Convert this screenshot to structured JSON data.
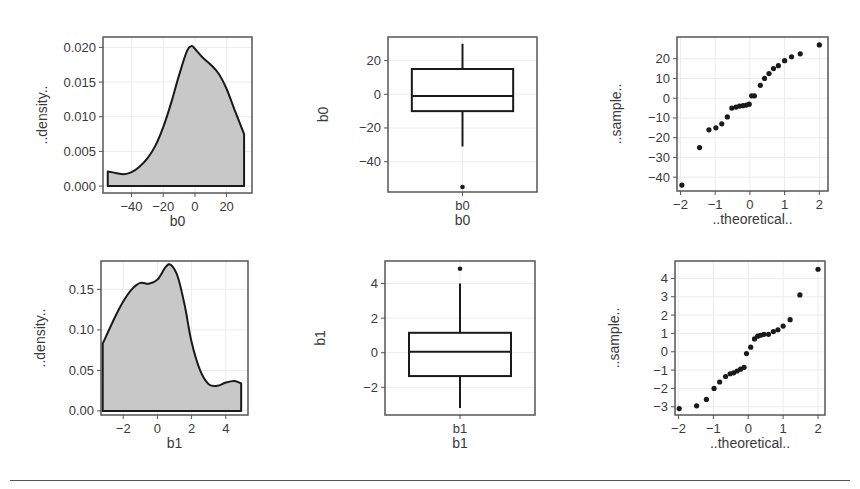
{
  "chart_data": [
    {
      "id": "b0_density",
      "type": "area",
      "xlabel": "b0",
      "ylabel": "..density..",
      "xlim": [
        -58,
        36
      ],
      "ylim": [
        -0.001,
        0.0215
      ],
      "xticks": [
        -40,
        -20,
        0,
        20
      ],
      "yticks": [
        0.0,
        0.005,
        0.01,
        0.015,
        0.02
      ],
      "ytick_labels": [
        "0.000",
        "0.005",
        "0.010",
        "0.015",
        "0.020"
      ],
      "x": [
        -55,
        -50,
        -45,
        -40,
        -35,
        -30,
        -25,
        -20,
        -15,
        -10,
        -5,
        -2,
        0,
        5,
        10,
        15,
        20,
        25,
        31
      ],
      "values": [
        0.0021,
        0.0019,
        0.0017,
        0.002,
        0.0028,
        0.004,
        0.0058,
        0.0085,
        0.012,
        0.016,
        0.0195,
        0.0202,
        0.0198,
        0.0185,
        0.0175,
        0.0162,
        0.014,
        0.011,
        0.0075
      ],
      "grid": true
    },
    {
      "id": "b0_boxplot",
      "type": "boxplot",
      "xlabel": "b0",
      "ylabel": "b0",
      "category": "b0",
      "ylim": [
        -58,
        34
      ],
      "yticks": [
        -40,
        -20,
        0,
        20
      ],
      "whisker_low": -31,
      "q1": -10,
      "median": -1,
      "q3": 15,
      "whisker_high": 30,
      "outliers": [
        -55
      ],
      "grid": true
    },
    {
      "id": "b0_qq",
      "type": "scatter",
      "xlabel": "..theoretical..",
      "ylabel": "..sample..",
      "xlim": [
        -2.1,
        2.25
      ],
      "ylim": [
        -47,
        31
      ],
      "xticks": [
        -2,
        -1,
        0,
        1,
        2
      ],
      "yticks": [
        -40,
        -30,
        -20,
        -10,
        0,
        10,
        20
      ],
      "x": [
        -1.96,
        -1.45,
        -1.18,
        -0.98,
        -0.81,
        -0.65,
        -0.52,
        -0.4,
        -0.3,
        -0.2,
        -0.1,
        -0.02,
        0.05,
        0.13,
        0.3,
        0.42,
        0.55,
        0.68,
        0.82,
        1.0,
        1.2,
        1.45,
        2.0
      ],
      "values": [
        -44,
        -25,
        -16,
        -15,
        -13,
        -9.5,
        -5,
        -4.5,
        -4,
        -3.8,
        -3.5,
        -3,
        1.2,
        1.2,
        6.5,
        10,
        12.5,
        15,
        16.5,
        19,
        21,
        22.5,
        27
      ],
      "grid": true
    },
    {
      "id": "b1_density",
      "type": "area",
      "xlabel": "b1",
      "ylabel": "..density..",
      "xlim": [
        -3.3,
        5.3
      ],
      "ylim": [
        -0.005,
        0.185
      ],
      "xticks": [
        -2,
        0,
        2,
        4
      ],
      "yticks": [
        0.0,
        0.05,
        0.1,
        0.15
      ],
      "ytick_labels": [
        "0.00",
        "0.05",
        "0.10",
        "0.15"
      ],
      "x": [
        -3.2,
        -2.5,
        -2.0,
        -1.5,
        -1.0,
        -0.5,
        0.0,
        0.5,
        0.8,
        1.2,
        1.6,
        2.0,
        2.5,
        3.0,
        3.5,
        4.0,
        4.5,
        4.9
      ],
      "values": [
        0.083,
        0.115,
        0.135,
        0.15,
        0.158,
        0.157,
        0.162,
        0.178,
        0.18,
        0.165,
        0.13,
        0.085,
        0.05,
        0.033,
        0.031,
        0.035,
        0.037,
        0.034
      ],
      "grid": true
    },
    {
      "id": "b1_boxplot",
      "type": "boxplot",
      "xlabel": "b1",
      "ylabel": "b1",
      "category": "b1",
      "ylim": [
        -3.6,
        5.3
      ],
      "yticks": [
        -2,
        0,
        2,
        4
      ],
      "whisker_low": -3.2,
      "q1": -1.35,
      "median": 0.05,
      "q3": 1.15,
      "whisker_high": 4.0,
      "outliers": [
        4.85
      ],
      "grid": true
    },
    {
      "id": "b1_qq",
      "type": "scatter",
      "xlabel": "..theoretical..",
      "ylabel": "..sample..",
      "xlim": [
        -2.1,
        2.2
      ],
      "ylim": [
        -3.45,
        4.95
      ],
      "xticks": [
        -2,
        -1,
        0,
        1,
        2
      ],
      "yticks": [
        -3,
        -2,
        -1,
        0,
        1,
        2,
        3,
        4
      ],
      "x": [
        -1.98,
        -1.48,
        -1.2,
        -0.98,
        -0.82,
        -0.65,
        -0.52,
        -0.42,
        -0.32,
        -0.22,
        -0.12,
        -0.05,
        0.07,
        0.18,
        0.27,
        0.35,
        0.45,
        0.58,
        0.72,
        0.85,
        1.0,
        1.2,
        1.48,
        2.0
      ],
      "values": [
        -3.1,
        -2.95,
        -2.6,
        -2.0,
        -1.65,
        -1.35,
        -1.2,
        -1.15,
        -1.05,
        -0.95,
        -0.85,
        -0.1,
        0.25,
        0.7,
        0.85,
        0.9,
        0.95,
        0.95,
        1.1,
        1.2,
        1.4,
        1.75,
        3.1,
        4.5
      ],
      "grid": true
    }
  ],
  "figure": {
    "panels": [
      {
        "chart": 0,
        "frame": [
          103,
          37,
          252,
          193
        ]
      },
      {
        "chart": 1,
        "frame": [
          388,
          37,
          537,
          192
        ]
      },
      {
        "chart": 2,
        "frame": [
          677,
          37,
          828,
          191
        ]
      },
      {
        "chart": 3,
        "frame": [
          101,
          261,
          248,
          415
        ]
      },
      {
        "chart": 4,
        "frame": [
          385,
          261,
          535,
          415
        ]
      },
      {
        "chart": 5,
        "frame": [
          675,
          261,
          825,
          415
        ]
      }
    ],
    "boxplot_second_label": true
  },
  "colors": {
    "fill": "#c8c8c8",
    "line": "#1a1a1a",
    "frame": "#555555",
    "grid": "#ececec",
    "point": "#1a1a1a",
    "text": "#3a3a3a"
  }
}
